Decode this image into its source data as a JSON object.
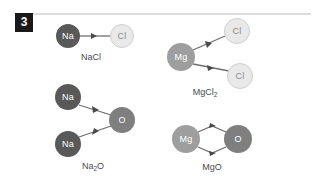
{
  "figure": {
    "badge_number": "3",
    "background_color": "#ffffff",
    "rule_color": "#dcdcdc",
    "badge_bg_color": "#1a1a1a",
    "badge_text_color": "#ffffff",
    "label_color": "#4a4a4a"
  },
  "palette": {
    "sodium": "#595959",
    "chlorine": "#e9e9e9",
    "chlorine_border": "#cfcfcf",
    "chlorine_text": "#8a8a8a",
    "magnesium": "#9e9e9e",
    "oxygen": "#7f7f7f",
    "bond_line": "#6e6e6e"
  },
  "molecules": [
    {
      "id": "nacl",
      "formula_html": "NaCl",
      "formula_text": "NaCl",
      "atoms": [
        {
          "symbol": "Na",
          "element": "sodium",
          "cx": 68,
          "cy": 36,
          "r": 12,
          "style": "dark"
        },
        {
          "symbol": "Cl",
          "element": "chlorine",
          "cx": 122,
          "cy": 36,
          "r": 12,
          "style": "light"
        }
      ],
      "bonds": [
        {
          "from": "Na",
          "to": "Cl",
          "x1": 80,
          "y1": 36,
          "x2": 110,
          "y2": 36,
          "arrow": "midpoint"
        }
      ],
      "label_x": 91,
      "label_y": 57
    },
    {
      "id": "mgcl2",
      "formula_html": "MgCl<sub>2</sub>",
      "formula_text": "MgCl2",
      "atoms": [
        {
          "symbol": "Mg",
          "element": "magnesium",
          "cx": 181,
          "cy": 57,
          "r": 14,
          "style": "mid"
        },
        {
          "symbol": "Cl",
          "element": "chlorine",
          "cx": 237,
          "cy": 31,
          "r": 13,
          "style": "light"
        },
        {
          "symbol": "Cl",
          "element": "chlorine",
          "cx": 240,
          "cy": 76,
          "r": 13,
          "style": "light"
        }
      ],
      "bonds": [
        {
          "from": "Mg",
          "to": "Cl",
          "x1": 193,
          "y1": 51,
          "x2": 225,
          "y2": 37,
          "arrow": "midpoint"
        },
        {
          "from": "Mg",
          "to": "Cl",
          "x1": 193,
          "y1": 64,
          "x2": 228,
          "y2": 70,
          "arrow": "midpoint"
        }
      ],
      "label_x": 205,
      "label_y": 92
    },
    {
      "id": "na2o",
      "formula_html": "Na<sub>2</sub>O",
      "formula_text": "Na2O",
      "atoms": [
        {
          "symbol": "Na",
          "element": "sodium",
          "cx": 68,
          "cy": 97,
          "r": 13,
          "style": "dark"
        },
        {
          "symbol": "Na",
          "element": "sodium",
          "cx": 68,
          "cy": 144,
          "r": 13,
          "style": "dark"
        },
        {
          "symbol": "O",
          "element": "oxygen",
          "cx": 122,
          "cy": 120,
          "r": 13,
          "style": "oxy"
        }
      ],
      "bonds": [
        {
          "from": "Na",
          "to": "O",
          "x1": 79,
          "y1": 104,
          "x2": 111,
          "y2": 115,
          "arrow": "midpoint"
        },
        {
          "from": "Na",
          "to": "O",
          "x1": 79,
          "y1": 138,
          "x2": 111,
          "y2": 126,
          "arrow": "midpoint"
        }
      ],
      "label_x": 93,
      "label_y": 166
    },
    {
      "id": "mgo",
      "formula_html": "MgO",
      "formula_text": "MgO",
      "atoms": [
        {
          "symbol": "Mg",
          "element": "magnesium",
          "cx": 186,
          "cy": 139,
          "r": 14,
          "style": "mid"
        },
        {
          "symbol": "O",
          "element": "oxygen",
          "cx": 238,
          "cy": 139,
          "r": 14,
          "style": "oxy"
        }
      ],
      "bonds": [
        {
          "from": "Mg",
          "to": "O",
          "path": "M198,131 L212,125 L226,131",
          "arrow": "apex-top"
        },
        {
          "from": "Mg",
          "to": "O",
          "path": "M198,147 L212,153 L226,147",
          "arrow": "apex-bottom"
        }
      ],
      "label_x": 212,
      "label_y": 167
    }
  ]
}
